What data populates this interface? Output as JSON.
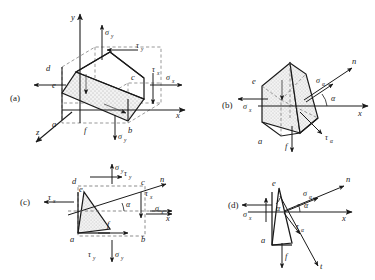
{
  "figure": {
    "background": "#ffffff",
    "stroke": "#1a1a1a",
    "hatch_fill": "#e8e8e8"
  },
  "panels": [
    {
      "id": "a",
      "label": "(a)",
      "description": "Three-dimensional stress cube with inclined cutting plane d-e-a-f-b-c",
      "vertices": [
        "d",
        "e",
        "c",
        "a",
        "f",
        "b"
      ],
      "axes": [
        "y",
        "x",
        "z"
      ],
      "stresses": [
        "sigma_y",
        "tau_y",
        "tau_x",
        "sigma_x"
      ],
      "labels": {
        "axis_y": "y",
        "axis_x": "x",
        "axis_z": "z",
        "sigma_y": "σ",
        "sigma_y_sub": "y",
        "tau_y": "τ",
        "tau_y_sub": "y",
        "tau_x": "τ",
        "tau_x_sub": "x",
        "sigma_x": "σ",
        "sigma_x_sub": "x",
        "v_d": "d",
        "v_e": "e",
        "v_c": "c",
        "v_a": "a",
        "v_f": "f",
        "v_b": "b"
      }
    },
    {
      "id": "b",
      "label": "(b)",
      "description": "Three-dimensional wedge element cut by inclined plane with normal n at angle alpha",
      "vertices": [
        "e",
        "a",
        "f"
      ],
      "axes": [
        "x",
        "n"
      ],
      "stresses": [
        "sigma_x",
        "sigma_alpha",
        "tau_alpha"
      ],
      "labels": {
        "axis_x": "x",
        "axis_n": "n",
        "angle": "α",
        "sigma_x": "σ",
        "sigma_x_sub": "x",
        "sigma_alpha": "σ",
        "sigma_alpha_sub": "α",
        "tau_alpha": "τ",
        "tau_alpha_sub": "α",
        "v_e": "e",
        "v_a": "a",
        "v_f": "f"
      }
    },
    {
      "id": "c",
      "label": "(c)",
      "description": "Two-dimensional plane stress element a-b-c-d with inclined section e-f and normal n",
      "vertices": [
        "d",
        "e",
        "c",
        "a",
        "f",
        "b"
      ],
      "axes": [
        "x",
        "n"
      ],
      "stresses": [
        "sigma_y",
        "tau_y",
        "tau_x",
        "sigma_x"
      ],
      "labels": {
        "axis_x": "x",
        "axis_n": "n",
        "angle": "α",
        "sigma_y_top": "σ",
        "sigma_y_top_sub": "y",
        "tau_y_top": "τ",
        "tau_y_top_sub": "y",
        "tau_x_left": "τ",
        "tau_x_left_sub": "x",
        "tau_x_right": "τ",
        "tau_x_right_sub": "x",
        "sigma_x_right": "σ",
        "sigma_x_right_sub": "x",
        "tau_y_bottom": "τ",
        "tau_y_bottom_sub": "y",
        "sigma_y_bottom": "σ",
        "sigma_y_bottom_sub": "y",
        "v_d": "d",
        "v_e": "e",
        "v_c": "c",
        "v_a": "a",
        "v_f": "f",
        "v_b": "b"
      }
    },
    {
      "id": "d",
      "label": "(d)",
      "description": "Two-dimensional wedge free body e-a-f with normal n, tangent t and angle alpha",
      "vertices": [
        "e",
        "a",
        "f"
      ],
      "axes": [
        "x",
        "n",
        "t"
      ],
      "stresses": [
        "sigma_x",
        "sigma_alpha",
        "tau_alpha"
      ],
      "labels": {
        "axis_x": "x",
        "axis_n": "n",
        "axis_t": "t",
        "angle_inner": "α",
        "angle_outer": "α",
        "sigma_x": "σ",
        "sigma_x_sub": "x",
        "sigma_alpha": "σ",
        "sigma_alpha_sub": "α",
        "tau_alpha": "τ",
        "tau_alpha_sub": "α",
        "v_e": "e",
        "v_a": "a",
        "v_f": "f"
      }
    }
  ]
}
